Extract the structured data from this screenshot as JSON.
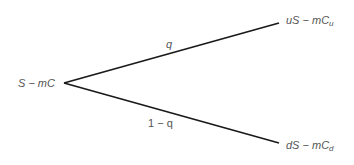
{
  "diagram": {
    "type": "binomial-tree",
    "root": {
      "label": "S − mC"
    },
    "up": {
      "label_main": "uS − mC",
      "label_sub": "u",
      "probability": "q"
    },
    "down": {
      "label_main": "dS − mC",
      "label_sub": "d",
      "probability": "1 − q"
    },
    "colors": {
      "line": "#1a1a1a",
      "text": "#555555",
      "background": "#ffffff"
    }
  }
}
